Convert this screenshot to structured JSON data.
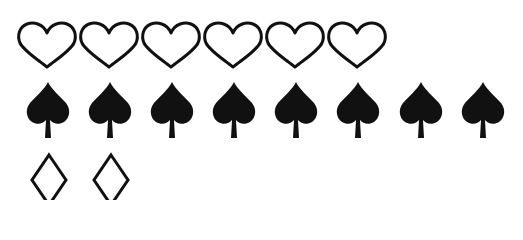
{
  "layout": {
    "width": 523,
    "height": 200,
    "background": "#ffffff",
    "ink_color": "#111111"
  },
  "rows": [
    {
      "name": "hearts",
      "icon": "heart-outline-icon",
      "count": 6,
      "filled": false,
      "glyph": "♡"
    },
    {
      "name": "spades",
      "icon": "spade-filled-icon",
      "count": 8,
      "filled": true,
      "glyph": "♠"
    },
    {
      "name": "diamonds",
      "icon": "diamond-outline-icon",
      "count": 2,
      "filled": false,
      "glyph": "♢"
    }
  ]
}
